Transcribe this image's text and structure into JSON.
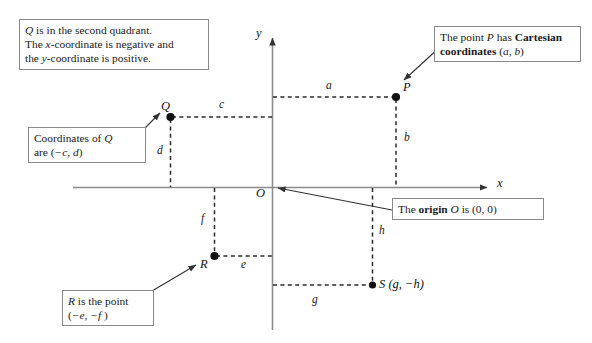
{
  "figure": {
    "background_color": "#ffffff",
    "axis_color": "#808080",
    "dash_color": "#333333",
    "box_border_color": "#8a8a8a",
    "text_color": "#1a1a1a"
  },
  "axes": {
    "x_label": "x",
    "y_label": "y",
    "origin_label": "O"
  },
  "points": {
    "P": {
      "label": "P",
      "coord_text": "(a, b)"
    },
    "Q": {
      "label": "Q",
      "coord_text": "(−c, d)"
    },
    "R": {
      "label": "R",
      "coord_text": "(−e, −f )"
    },
    "S": {
      "label": "S (g, −h)"
    }
  },
  "segments": {
    "a": "a",
    "b": "b",
    "c": "c",
    "d": "d",
    "e": "e",
    "f": "f",
    "g": "g",
    "h": "h"
  },
  "callouts": {
    "quadrant": {
      "line1_a": "Q",
      "line1_b": " is in the second quadrant.",
      "line2_a": "The ",
      "line2_b": "x",
      "line2_c": "-coordinate is negative and",
      "line3_a": "the ",
      "line3_b": "y",
      "line3_c": "-coordinate is positive."
    },
    "q_coords": {
      "line1_a": "Coordinates of ",
      "line1_b": "Q",
      "line2_a": "are (",
      "line2_b": "−c, d",
      "line2_c": ")"
    },
    "p_cartesian": {
      "line1_a": "The point ",
      "line1_b": "P",
      "line1_c": " has ",
      "line1_d": "Cartesian",
      "line2_a": "coordinates",
      "line2_b": " (",
      "line2_c": "a, b",
      "line2_d": ")"
    },
    "origin": {
      "a": "The ",
      "b": "origin",
      "c": " ",
      "d": "O",
      "e": " is (0, 0)"
    },
    "r_point": {
      "line1_a": "R",
      "line1_b": " is the point",
      "line2_a": "(",
      "line2_b": "−e, −f",
      "line2_c": " )"
    }
  }
}
